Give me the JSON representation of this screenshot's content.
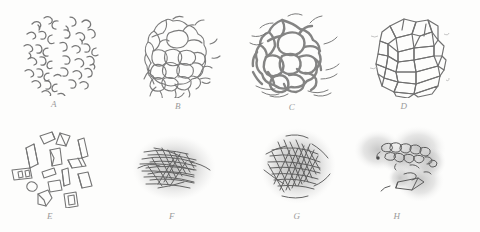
{
  "figure": {
    "kind": "scientific-plate",
    "background_color": "#fdfdfc",
    "ink_color": "#6e6e6e",
    "label_color": "#9a9a9a",
    "halo_color": "#b9b9b9",
    "rows": 2,
    "columns": 4,
    "panel_count": 8
  },
  "panels": [
    {
      "id": "A",
      "label": "A",
      "name": "panel-a",
      "description": "scattered small crescent and comma shaped marks forming a rounded cluster",
      "motif": "crescents",
      "has_halo": false,
      "x": 18,
      "y": 8,
      "w": 90,
      "h": 88,
      "label_x": 54,
      "label_y": 99
    },
    {
      "id": "B",
      "label": "B",
      "name": "panel-b",
      "description": "network of rounded polygonal cells forming a compact foam like mass",
      "motif": "rounded-cell-network",
      "has_halo": false,
      "x": 140,
      "y": 14,
      "w": 82,
      "h": 84,
      "label_x": 178,
      "label_y": 101
    },
    {
      "id": "C",
      "label": "C",
      "name": "panel-c",
      "description": "coarse thick walled network with large irregular cells and trailing strands",
      "motif": "coarse-cell-network",
      "has_halo": false,
      "x": 248,
      "y": 10,
      "w": 96,
      "h": 92,
      "label_x": 292,
      "label_y": 102
    },
    {
      "id": "D",
      "label": "D",
      "name": "panel-d",
      "description": "angular blocky crystalline polygons packed into a rounded aggregate",
      "motif": "angular-blocks-packed",
      "has_halo": false,
      "x": 368,
      "y": 14,
      "w": 82,
      "h": 84,
      "label_x": 404,
      "label_y": 101
    },
    {
      "id": "E",
      "label": "E",
      "name": "panel-e",
      "description": "separate scattered angular prisms and plates with outlined facets",
      "motif": "scattered-prisms",
      "has_halo": false,
      "x": 8,
      "y": 128,
      "w": 92,
      "h": 80,
      "label_x": 50,
      "label_y": 211
    },
    {
      "id": "F",
      "label": "F",
      "name": "panel-f",
      "description": "bundle of near horizontal fibrous strokes inside a diffuse grey halo",
      "motif": "horizontal-fibres",
      "has_halo": true,
      "x": 128,
      "y": 128,
      "w": 92,
      "h": 80,
      "label_x": 172,
      "label_y": 211
    },
    {
      "id": "G",
      "label": "G",
      "name": "panel-g",
      "description": "dense tangled fibre mat in a round diffuse grey halo",
      "motif": "tangled-fibres",
      "has_halo": true,
      "x": 252,
      "y": 124,
      "w": 92,
      "h": 84,
      "label_x": 297,
      "label_y": 211
    },
    {
      "id": "H",
      "label": "H",
      "name": "panel-h",
      "description": "butterfly shaped diffuse grey mass with a chain of small cell outlines across the upper right",
      "motif": "cells-in-diffuse-mass",
      "has_halo": true,
      "x": 352,
      "y": 124,
      "w": 100,
      "h": 84,
      "label_x": 397,
      "label_y": 211
    }
  ]
}
